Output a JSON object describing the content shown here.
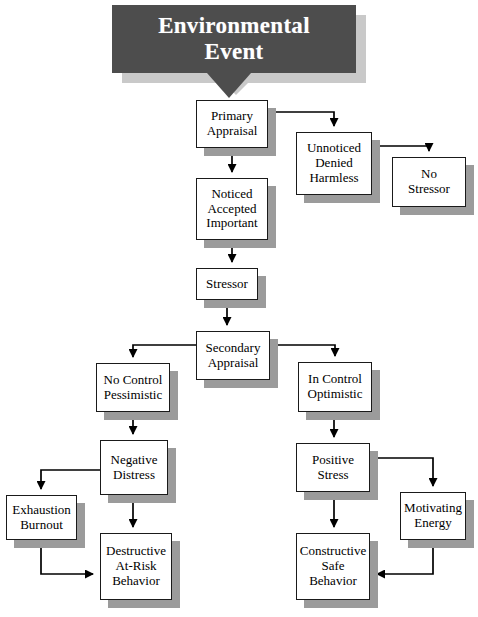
{
  "diagram": {
    "title": "Environmental Event",
    "type": "flowchart",
    "colors": {
      "banner_fill": "#4d4d4d",
      "banner_text": "#ffffff",
      "banner_shadow": "#c9c9c9",
      "node_fill": "#ffffff",
      "node_border": "#1a1a1a",
      "node_shadow": "#9b9b9b",
      "connector": "#000000",
      "background": "#ffffff"
    },
    "header": {
      "label": "Environmental\nEvent",
      "x": 112,
      "y": 5,
      "w": 244,
      "h": 68,
      "shadow_dx": 10,
      "shadow_dy": 10
    },
    "nodes": [
      {
        "id": "primary-appraisal",
        "label": "Primary\nAppraisal",
        "x": 196,
        "y": 100,
        "w": 72,
        "h": 48
      },
      {
        "id": "unnoticed-denied-harmless",
        "label": "Unnoticed\nDenied\nHarmless",
        "x": 296,
        "y": 132,
        "w": 76,
        "h": 63
      },
      {
        "id": "no-stressor",
        "label": "No\nStressor",
        "x": 392,
        "y": 157,
        "w": 74,
        "h": 50
      },
      {
        "id": "noticed-accepted-important",
        "label": "Noticed\nAccepted\nImportant",
        "x": 196,
        "y": 178,
        "w": 72,
        "h": 62
      },
      {
        "id": "stressor",
        "label": "Stressor",
        "x": 196,
        "y": 268,
        "w": 62,
        "h": 32
      },
      {
        "id": "secondary-appraisal",
        "label": "Secondary\nAppraisal",
        "x": 196,
        "y": 331,
        "w": 74,
        "h": 49
      },
      {
        "id": "no-control-pessimistic",
        "label": "No Control\nPessimistic",
        "x": 96,
        "y": 363,
        "w": 74,
        "h": 49
      },
      {
        "id": "in-control-optimistic",
        "label": "In Control\nOptimistic",
        "x": 298,
        "y": 362,
        "w": 74,
        "h": 50
      },
      {
        "id": "negative-distress",
        "label": "Negative\nDistress",
        "x": 100,
        "y": 440,
        "w": 68,
        "h": 55
      },
      {
        "id": "positive-stress",
        "label": "Positive\nStress",
        "x": 296,
        "y": 443,
        "w": 74,
        "h": 49
      },
      {
        "id": "exhaustion-burnout",
        "label": "Exhaustion\nBurnout",
        "x": 6,
        "y": 495,
        "w": 71,
        "h": 45
      },
      {
        "id": "motivating-energy",
        "label": "Motivating\nEnergy",
        "x": 400,
        "y": 492,
        "w": 66,
        "h": 48
      },
      {
        "id": "destructive-at-risk-behavior",
        "label": "Destructive\nAt-Risk\nBehavior",
        "x": 100,
        "y": 533,
        "w": 72,
        "h": 67
      },
      {
        "id": "constructive-safe-behavior",
        "label": "Constructive\nSafe\nBehavior",
        "x": 296,
        "y": 533,
        "w": 74,
        "h": 67
      }
    ],
    "edges": [
      {
        "from": "header",
        "to": "primary-appraisal",
        "kind": "notch-down"
      },
      {
        "from": "primary-appraisal",
        "to": "noticed-accepted-important",
        "kind": "straight-down"
      },
      {
        "from": "primary-appraisal",
        "to": "unnoticed-denied-harmless",
        "kind": "right-then-down"
      },
      {
        "from": "unnoticed-denied-harmless",
        "to": "no-stressor",
        "kind": "right-then-down"
      },
      {
        "from": "noticed-accepted-important",
        "to": "stressor",
        "kind": "straight-down"
      },
      {
        "from": "stressor",
        "to": "secondary-appraisal",
        "kind": "straight-down"
      },
      {
        "from": "secondary-appraisal",
        "to": "no-control-pessimistic",
        "kind": "left-then-down"
      },
      {
        "from": "secondary-appraisal",
        "to": "in-control-optimistic",
        "kind": "right-then-down"
      },
      {
        "from": "no-control-pessimistic",
        "to": "negative-distress",
        "kind": "straight-down"
      },
      {
        "from": "in-control-optimistic",
        "to": "positive-stress",
        "kind": "straight-down"
      },
      {
        "from": "negative-distress",
        "to": "exhaustion-burnout",
        "kind": "left-then-down"
      },
      {
        "from": "negative-distress",
        "to": "destructive-at-risk-behavior",
        "kind": "straight-down"
      },
      {
        "from": "exhaustion-burnout",
        "to": "destructive-at-risk-behavior",
        "kind": "down-then-right"
      },
      {
        "from": "positive-stress",
        "to": "motivating-energy",
        "kind": "right-then-down"
      },
      {
        "from": "positive-stress",
        "to": "constructive-safe-behavior",
        "kind": "straight-down"
      },
      {
        "from": "motivating-energy",
        "to": "constructive-safe-behavior",
        "kind": "down-then-left"
      }
    ]
  }
}
